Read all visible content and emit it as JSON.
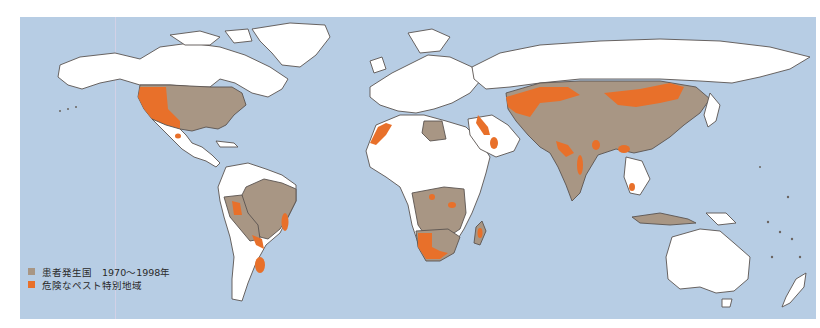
{
  "map": {
    "subject": "Plague occurrence world map",
    "colors": {
      "ocean": "#b7cde4",
      "unaffected_land": "#ffffff",
      "affected_country": "#a89684",
      "danger_zone": "#e8702a",
      "border": "#5a5450"
    },
    "regions_affected": [
      "United States",
      "Brazil",
      "Peru",
      "Bolivia",
      "Ecuador",
      "Libya",
      "Democratic Republic of the Congo",
      "Tanzania",
      "Uganda",
      "Kenya",
      "Angola",
      "Zambia",
      "Zimbabwe",
      "Mozambique",
      "Botswana",
      "Namibia",
      "South Africa",
      "Madagascar",
      "Kazakhstan",
      "Mongolia",
      "China",
      "India",
      "Myanmar",
      "Vietnam",
      "Indonesia",
      "Russia (southern)"
    ],
    "danger_zones": [
      "Western USA",
      "Northern Mexico",
      "Peru/Ecuador",
      "Eastern Brazil",
      "Bolivia/Paraguay",
      "Northern Argentina",
      "Morocco/Western Sahara",
      "Middle East",
      "Arabian Peninsula",
      "Central Asia / Caspian",
      "Mongolia",
      "Southern China",
      "Western India",
      "Vietnam",
      "East Africa",
      "Southern Africa",
      "Madagascar"
    ]
  },
  "legend": {
    "items": [
      {
        "label": "患者発生国　1970〜1998年",
        "color": "#a89684"
      },
      {
        "label": "危険なペスト特別地域",
        "color": "#e8702a"
      }
    ]
  }
}
